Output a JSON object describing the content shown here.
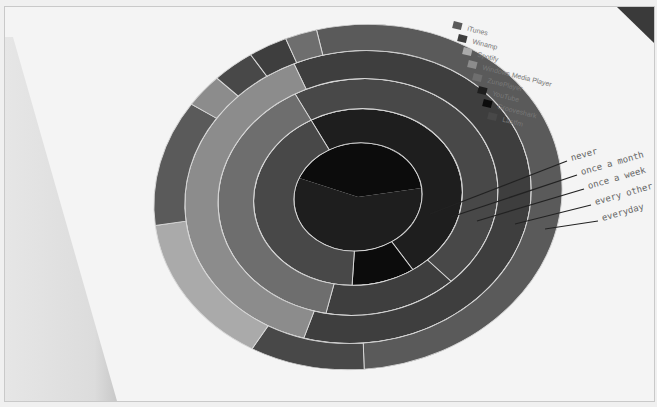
{
  "chart_data": {
    "type": "sunburst",
    "title": "",
    "legend": {
      "position": "top-right",
      "entries": [
        {
          "name": "iTunes",
          "color": "#5a5a5a"
        },
        {
          "name": "Winamp",
          "color": "#3e3e3e"
        },
        {
          "name": "Spotify",
          "color": "#aaaaaa"
        },
        {
          "name": "Windows Media Player",
          "color": "#8c8c8c"
        },
        {
          "name": "ZunePlayer",
          "color": "#6e6e6e"
        },
        {
          "name": "YouTube",
          "color": "#1e1e1e"
        },
        {
          "name": "Grooveshark",
          "color": "#0c0c0c"
        },
        {
          "name": "Lastfm",
          "color": "#484848"
        }
      ]
    },
    "rings": [
      {
        "name": "never",
        "level": 1,
        "segments": [
          {
            "service": "Grooveshark",
            "start": -150,
            "end": 0
          },
          {
            "service": "YouTube",
            "start": 0,
            "end": 210
          }
        ]
      },
      {
        "name": "once a month",
        "level": 2,
        "segments": [
          {
            "service": "YouTube",
            "start": -110,
            "end": 65
          },
          {
            "service": "Grooveshark",
            "start": 65,
            "end": 100
          },
          {
            "service": "Lastfm",
            "start": 100,
            "end": 250
          }
        ]
      },
      {
        "name": "once a week",
        "level": 3,
        "segments": [
          {
            "service": "Lastfm",
            "start": -110,
            "end": 55
          },
          {
            "service": "Winamp",
            "start": 55,
            "end": 110
          },
          {
            "service": "ZunePlayer",
            "start": 110,
            "end": 250
          }
        ]
      },
      {
        "name": "every other day",
        "level": 4,
        "segments": [
          {
            "service": "Winamp",
            "start": -105,
            "end": 115
          },
          {
            "service": "Windows Media Player",
            "start": 115,
            "end": 255
          }
        ]
      },
      {
        "name": "everyday",
        "level": 5,
        "segments": [
          {
            "service": "iTunes",
            "start": -95,
            "end": 95
          },
          {
            "service": "Lastfm",
            "start": 95,
            "end": 128
          },
          {
            "service": "Spotify",
            "start": 128,
            "end": 180
          },
          {
            "service": "iTunes",
            "start": 180,
            "end": 222
          },
          {
            "service": "Windows Media Player",
            "start": 222,
            "end": 233
          },
          {
            "service": "Lastfm",
            "start": 233,
            "end": 245
          },
          {
            "service": "Winamp",
            "start": 245,
            "end": 256
          },
          {
            "service": "ZunePlayer",
            "start": 256,
            "end": 265
          }
        ]
      }
    ],
    "ring_labels": [
      "never",
      "once a month",
      "once a week",
      "every other day",
      "everyday"
    ]
  },
  "legend_labels": [
    "iTunes",
    "Winamp",
    "Spotify",
    "Windows Media Player",
    "ZunePlayer",
    "YouTube",
    "Grooveshark",
    "Lastfm"
  ],
  "ring_labels": [
    "never",
    "once a month",
    "once a week",
    "every other",
    "everyday"
  ]
}
